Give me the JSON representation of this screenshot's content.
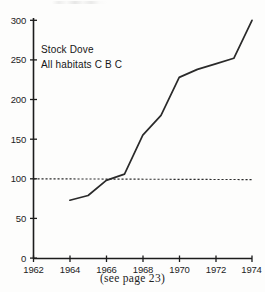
{
  "chart_data": {
    "type": "line",
    "title": "",
    "xlabel": "",
    "ylabel": "",
    "xlim": [
      1962,
      1974
    ],
    "ylim": [
      0,
      300
    ],
    "grid": false,
    "legend": "none",
    "annotations": [
      "Stock Dove",
      "All habitats C B C"
    ],
    "caption": "(see page 23)",
    "ytick_labels": [
      "0",
      "50",
      "100",
      "150",
      "200",
      "250",
      "300"
    ],
    "ytick_values": [
      0,
      50,
      100,
      150,
      200,
      250,
      300
    ],
    "xtick_labels": [
      "1962",
      "1964",
      "1966",
      "1968",
      "1970",
      "1972",
      "1974"
    ],
    "xtick_values": [
      1962,
      1964,
      1966,
      1968,
      1970,
      1972,
      1974
    ],
    "reference_line": {
      "label": "index 100 baseline",
      "y": 100,
      "style": "dashed",
      "x_start": 1962,
      "x_end": 1974
    },
    "series": [
      {
        "name": "Stock Dove index",
        "style": "solid",
        "x": [
          1964,
          1965,
          1966,
          1967,
          1968,
          1969,
          1970,
          1971,
          1972,
          1973,
          1974
        ],
        "values": [
          73,
          79,
          98,
          106,
          155,
          180,
          228,
          238,
          245,
          252,
          300
        ]
      }
    ]
  },
  "colors": {
    "ink": "#1c1c1c",
    "paper": "#fdfdfc",
    "line": "#2a2a2a"
  }
}
